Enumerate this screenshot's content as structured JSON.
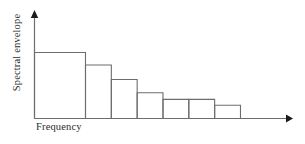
{
  "chart_data": {
    "type": "bar",
    "title": "",
    "subtitle": "",
    "xlabel": "Frequency",
    "ylabel": "Spectral envelope",
    "categories": [
      "1",
      "2",
      "3",
      "4",
      "5",
      "6",
      "7"
    ],
    "values": [
      100,
      81,
      59,
      39,
      29,
      29,
      20
    ],
    "xlim": [
      0,
      8.1
    ],
    "ylim": [
      0,
      100
    ],
    "grid": false,
    "legend": null,
    "legend_position": "none",
    "axis_ticks": false,
    "tick_labels": [],
    "annotations": [],
    "bar_fill": "#ffffff",
    "bar_stroke": "#6d6d6d",
    "axis_color": "#6d6d6d",
    "arrow_color": "#1b1b1b",
    "background": "#ffffff"
  },
  "figure": {
    "xlabel_text": "Frequency",
    "ylabel_text": "Spectral envelope"
  }
}
